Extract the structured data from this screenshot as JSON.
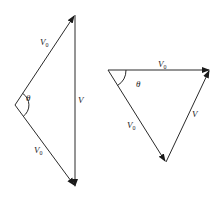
{
  "diagrams": [
    {
      "id": "left",
      "vertices": {
        "top": [
          75,
          15
        ],
        "left": [
          15,
          105
        ],
        "bottom": [
          75,
          187
        ]
      },
      "vectors": [
        {
          "from": "left",
          "to": "top",
          "label": "V",
          "subscript": "0",
          "label_pos": [
            40,
            45
          ]
        },
        {
          "from": "top",
          "to": "bottom",
          "label": "V",
          "subscript": "",
          "label_pos": [
            78,
            103
          ]
        },
        {
          "from": "left",
          "to": "bottom",
          "label": "V",
          "subscript": "0",
          "label_pos": [
            34,
            153
          ]
        }
      ],
      "angle": {
        "at": "left",
        "label": "θ",
        "label_pos": [
          26,
          101
        ]
      }
    },
    {
      "id": "right",
      "vertices": {
        "left": [
          108,
          70
        ],
        "right": [
          210,
          70
        ],
        "bottom": [
          166,
          162
        ]
      },
      "vectors": [
        {
          "from": "left",
          "to": "right",
          "label": "V",
          "subscript": "0",
          "label_pos": [
            158,
            67
          ]
        },
        {
          "from": "bottom",
          "to": "right",
          "label": "V",
          "subscript": "",
          "label_pos": [
            192,
            117
          ]
        },
        {
          "from": "left",
          "to": "bottom",
          "label": "V",
          "subscript": "0",
          "label_pos": [
            127,
            128
          ]
        }
      ],
      "angle": {
        "at": "left",
        "label": "θ",
        "label_pos": [
          136,
          87
        ]
      }
    }
  ],
  "colors": {
    "stroke": "#2a2a2a",
    "text": "#222222",
    "background": "#ffffff"
  }
}
